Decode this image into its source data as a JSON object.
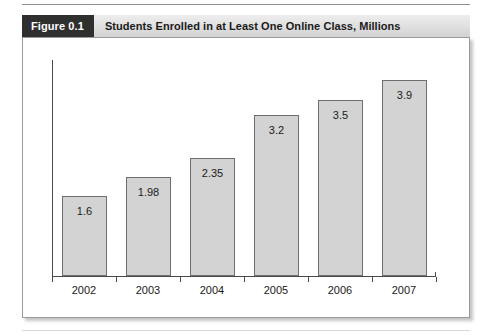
{
  "figure": {
    "tag": "Figure 0.1",
    "title": "Students Enrolled in at Least One Online Class, Millions"
  },
  "colors": {
    "tag_background": "#2f2f2f",
    "tag_text": "#ffffff",
    "header_background": "#e2e2e2",
    "bar_fill": "#d3d3d3",
    "bar_border": "#6e6e6e",
    "axis": "#4a4a4a",
    "frame_border": "#9a9a9a",
    "page_background": "#ffffff"
  },
  "chart_data": {
    "type": "bar",
    "title": "Students Enrolled in at Least One Online Class, Millions",
    "xlabel": "",
    "ylabel": "",
    "categories": [
      "2002",
      "2003",
      "2004",
      "2005",
      "2006",
      "2007"
    ],
    "values": [
      1.6,
      1.98,
      2.35,
      3.2,
      3.5,
      3.9
    ],
    "value_labels": [
      "1.6",
      "1.98",
      "2.35",
      "3.2",
      "3.5",
      "3.9"
    ],
    "ylim": [
      0,
      4.3
    ],
    "grid": false,
    "legend": false,
    "y_tick_labels": [],
    "label_position": "inside-top",
    "series": [
      {
        "name": "Students Enrolled in at Least One Online Class, Millions",
        "values": [
          1.6,
          1.98,
          2.35,
          3.2,
          3.5,
          3.9
        ]
      }
    ]
  }
}
